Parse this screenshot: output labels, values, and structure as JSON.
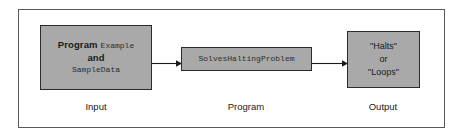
{
  "figure": {
    "frame_border_color": "#58585a",
    "box_fill_color": "#a9a9a9",
    "box_border_color": "#2b2b2b",
    "background_color": "#ffffff"
  },
  "input_box": {
    "label_program": "Program",
    "value_program": "Example",
    "conjunction": "and",
    "value_data": "SampleData"
  },
  "program_box": {
    "value": "SolvesHaltingProblem"
  },
  "output_box": {
    "line1": "\"Halts\"",
    "line2": "or",
    "line3": "\"Loops\""
  },
  "captions": {
    "input": "Input",
    "program": "Program",
    "output": "Output"
  },
  "arrows": {
    "input_to_program": "arrow-right-icon",
    "program_to_output": "arrow-right-icon"
  }
}
